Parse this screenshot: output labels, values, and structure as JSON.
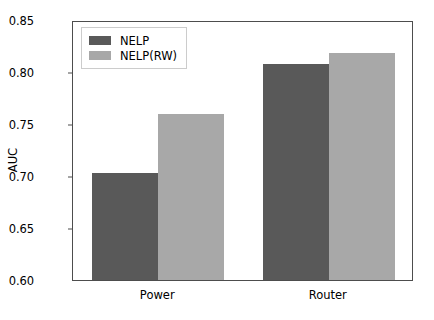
{
  "chart_data": {
    "type": "bar",
    "title": "",
    "xlabel": "",
    "ylabel": "AUC",
    "categories": [
      "Power",
      "Router"
    ],
    "series": [
      {
        "name": "NELP",
        "values": [
          0.703,
          0.808
        ],
        "color": "#595959"
      },
      {
        "name": "NELP(RW)",
        "values": [
          0.76,
          0.818
        ],
        "color": "#a8a8a8"
      }
    ],
    "ylim": [
      0.6,
      0.85
    ],
    "yticks": [
      0.6,
      0.65,
      0.7,
      0.75,
      0.8,
      0.85
    ],
    "ytick_labels": [
      "0.60",
      "0.65",
      "0.70",
      "0.75",
      "0.80",
      "0.85"
    ],
    "grid": false,
    "legend_position": "upper left"
  },
  "axes": {
    "y_label": "AUC"
  },
  "legend": {
    "entries": [
      {
        "label": "NELP",
        "color": "#595959"
      },
      {
        "label": "NELP(RW)",
        "color": "#a8a8a8"
      }
    ]
  }
}
